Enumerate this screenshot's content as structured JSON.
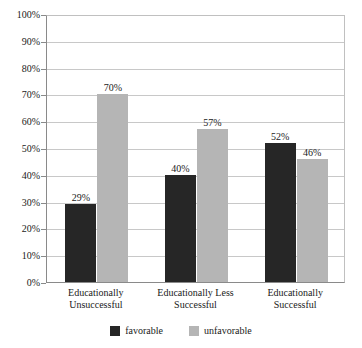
{
  "chart_data": {
    "type": "bar",
    "title": "",
    "subtitle": "",
    "xlabel": "",
    "ylabel": "",
    "ylim": [
      0,
      100
    ],
    "grid": true,
    "legend_position": "bottom",
    "categories": [
      "Educationally Unsuccessful",
      "Educationally Less Successful",
      "Educationally Successful"
    ],
    "category_lines": [
      [
        "Educationally",
        "Unsuccessful"
      ],
      [
        "Educationally Less",
        "Successful"
      ],
      [
        "Educationally",
        "Successful"
      ]
    ],
    "series": [
      {
        "name": "favorable",
        "color": "#262626",
        "values": [
          29,
          40,
          52
        ],
        "labels": [
          "29%",
          "40%",
          "52%"
        ]
      },
      {
        "name": "unfavorable",
        "color": "#b5b5b5",
        "values": [
          70,
          57,
          46
        ],
        "labels": [
          "70%",
          "57%",
          "46%"
        ]
      }
    ],
    "y_ticks": [
      0,
      10,
      20,
      30,
      40,
      50,
      60,
      70,
      80,
      90,
      100
    ],
    "y_tick_labels": [
      "0%",
      "10%",
      "20%",
      "30%",
      "40%",
      "50%",
      "60%",
      "70%",
      "80%",
      "90%",
      "100%"
    ]
  },
  "legend": {
    "items": [
      {
        "label": "favorable",
        "color": "#262626"
      },
      {
        "label": "unfavorable",
        "color": "#b5b5b5"
      }
    ]
  },
  "colors": {
    "favorable": "#262626",
    "unfavorable": "#b5b5b5",
    "gridline": "#c8c8c8",
    "axis": "#8a8a8a",
    "background": "#ffffff",
    "text": "#1a1a1a"
  }
}
